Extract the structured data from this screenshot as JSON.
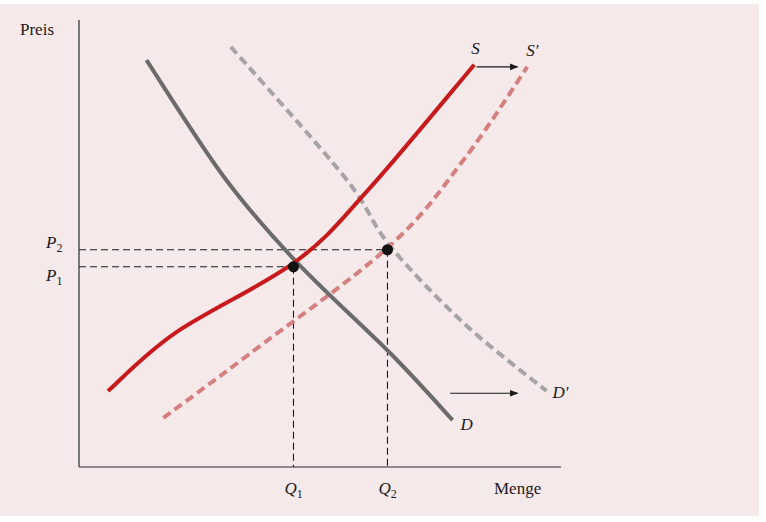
{
  "chart_data": {
    "type": "line",
    "title": "",
    "xlabel": "Menge",
    "ylabel": "Preis",
    "xlim": [
      0,
      10
    ],
    "ylim": [
      0,
      10
    ],
    "grid": false,
    "colors": {
      "supply": "#c8191c",
      "supply_shifted": "#d47f80",
      "demand": "#6b6b6b",
      "demand_shifted": "#a8a4a5",
      "guides": "#1a1a1a",
      "background": "#f5e9ea"
    },
    "series": [
      {
        "name": "S",
        "label": "S",
        "style": "solid",
        "color_key": "supply",
        "points": [
          [
            0.6,
            1.7
          ],
          [
            2.0,
            3.0
          ],
          [
            4.5,
            4.6
          ],
          [
            6.0,
            6.2
          ],
          [
            8.2,
            9.0
          ]
        ]
      },
      {
        "name": "S'",
        "label": "S'",
        "style": "dashed",
        "color_key": "supply_shifted",
        "points": [
          [
            1.75,
            1.1
          ],
          [
            3.5,
            2.5
          ],
          [
            6.45,
            4.95
          ],
          [
            8.0,
            6.9
          ],
          [
            9.3,
            8.95
          ]
        ]
      },
      {
        "name": "D",
        "label": "D",
        "style": "solid",
        "color_key": "demand",
        "points": [
          [
            1.4,
            9.1
          ],
          [
            3.0,
            6.5
          ],
          [
            4.5,
            4.6
          ],
          [
            6.5,
            2.5
          ],
          [
            7.75,
            1.05
          ]
        ]
      },
      {
        "name": "D'",
        "label": "D'",
        "style": "dashed",
        "color_key": "demand_shifted",
        "points": [
          [
            3.15,
            9.4
          ],
          [
            5.5,
            6.5
          ],
          [
            6.45,
            4.95
          ],
          [
            8.0,
            3.2
          ],
          [
            9.7,
            1.7
          ]
        ]
      }
    ],
    "equilibria": [
      {
        "name": "E1",
        "q": 4.45,
        "p": 4.48,
        "q_label": "Q",
        "q_sub": "1",
        "p_label": "P",
        "p_sub": "1"
      },
      {
        "name": "E2",
        "q": 6.4,
        "p": 4.86,
        "q_label": "Q",
        "q_sub": "2",
        "p_label": "P",
        "p_sub": "2"
      }
    ],
    "annotations": [
      {
        "type": "arrow",
        "meaning": "supply shift right",
        "from": [
          8.25,
          8.95
        ],
        "to": [
          9.1,
          8.95
        ]
      },
      {
        "type": "arrow",
        "meaning": "demand shift right",
        "from": [
          7.7,
          1.65
        ],
        "to": [
          9.1,
          1.65
        ]
      }
    ]
  }
}
